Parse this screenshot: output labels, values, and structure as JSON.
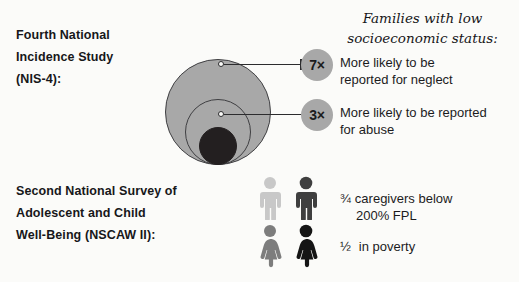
{
  "studies": {
    "nis4": {
      "line1": "Fourth National",
      "line2": "Incidence Study",
      "line3": "(NIS-4):"
    },
    "nscaw": {
      "line1": "Second National Survey of",
      "line2": "Adolescent and Child",
      "line3": "Well-Being (NSCAW II):"
    }
  },
  "ses": {
    "heading_line1": "Families with low",
    "heading_line2": "socioeconomic status:",
    "neglect": {
      "multiplier": "7×",
      "text_line1": "More likely to be",
      "text_line2": "reported for neglect"
    },
    "abuse": {
      "multiplier": "3×",
      "text_line1": "More likely to be reported",
      "text_line2": "for abuse"
    }
  },
  "poverty": {
    "fpl": {
      "fraction": "¾",
      "text_line1": "caregivers below",
      "text_line2": "200% FPL"
    },
    "in_poverty": {
      "fraction": "½",
      "text": "in poverty"
    }
  },
  "colors": {
    "circle_gray": "#a8a8a8",
    "circle_dark": "#231f20",
    "badge_gray": "#a8a8a8",
    "person_light": "#c8c8c8",
    "person_dark": "#4a4a4a",
    "person_gray": "#808080",
    "person_black": "#161616",
    "text": "#1b1b1d",
    "background": "#fbfbf9"
  }
}
